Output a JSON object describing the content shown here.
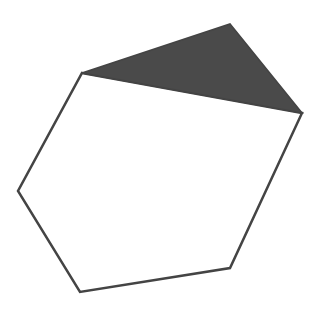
{
  "diagram": {
    "width": 320,
    "height": 312,
    "background": "#ffffff",
    "hexagon": {
      "points": "82,73 302,113 230,268 80,292 18,191",
      "fill": "#ffffff",
      "stroke": "#444444",
      "stroke_width": 2.5
    },
    "triangle": {
      "points": "82,73 230,24 302,113",
      "fill": "#4a4a4a",
      "stroke": "#444444",
      "stroke_width": 1.5
    }
  }
}
